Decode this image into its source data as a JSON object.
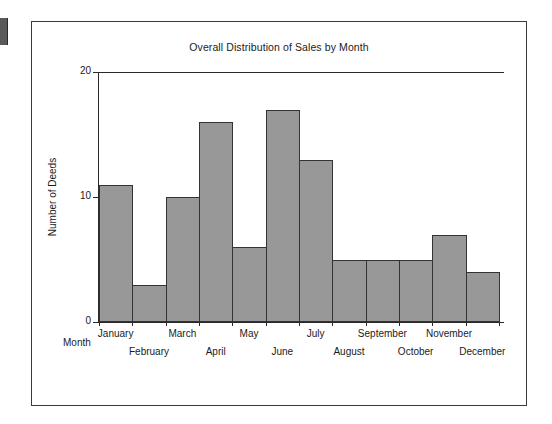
{
  "page": {
    "background_color": "#ffffff",
    "edge_marker_color": "#5a5a5a"
  },
  "panel": {
    "border_color": "#3a3a3a"
  },
  "chart_data": {
    "type": "bar",
    "title": "Overall Distribution of Sales by Month",
    "xlabel": "Month",
    "ylabel": "Number of Deeds",
    "categories": [
      "January",
      "February",
      "March",
      "April",
      "May",
      "June",
      "July",
      "August",
      "September",
      "October",
      "November",
      "December"
    ],
    "values": [
      11,
      3,
      10,
      16,
      6,
      17,
      13,
      5,
      5,
      5,
      7,
      4
    ],
    "ylim": [
      0,
      20
    ],
    "yticks": [
      0,
      10,
      20
    ],
    "ytick_labels": [
      "0",
      "10",
      "20"
    ],
    "grid": false,
    "legend": null,
    "bar_fill_color": "#989898",
    "bar_border_color": "#333333",
    "axis_color": "#2a2a2a",
    "bar_gap": 0,
    "label_stagger": true
  }
}
